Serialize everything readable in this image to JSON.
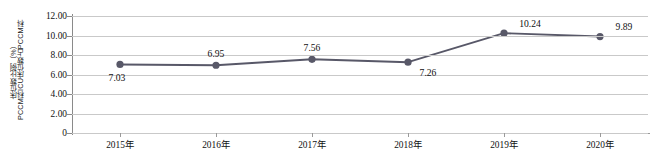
{
  "chart_data": {
    "type": "line",
    "title": "",
    "subtitle": "",
    "xlabel": "",
    "ylabel": "PCCM科ICU床位数占PCCM科床位数比例（%）",
    "ylabel_line1": "PCCM科ICU床位数占PCCM科",
    "ylabel_line2": "床位数比例（%）",
    "categories": [
      "2015年",
      "2016年",
      "2017年",
      "2018年",
      "2019年",
      "2020年"
    ],
    "values": [
      7.03,
      6.95,
      7.56,
      7.26,
      10.24,
      9.89
    ],
    "point_labels": [
      "7.03",
      "6.95",
      "7.56",
      "7.26",
      "10.24",
      "9.89"
    ],
    "ylim": [
      0,
      12
    ],
    "ytick_values": [
      0,
      2,
      4,
      6,
      8,
      10,
      12
    ],
    "ytick_labels": [
      "0",
      "2.00",
      "4.00",
      "6.00",
      "8.00",
      "10.00",
      "12.00"
    ],
    "grid": true,
    "grid_axis": "y",
    "legend": false,
    "legend_position": "none",
    "series_color": "#585868",
    "marker": "circle",
    "marker_color": "#585868",
    "gridline_color": "#c9c9c9",
    "axis_color": "#8a8a8a",
    "text_color": "#111111",
    "background": "#ffffff",
    "label_offsets": [
      {
        "dx": -3,
        "dy": 13
      },
      {
        "dx": 0,
        "dy": -12
      },
      {
        "dx": 0,
        "dy": -12
      },
      {
        "dx": 20,
        "dy": 10
      },
      {
        "dx": 26,
        "dy": -10
      },
      {
        "dx": 24,
        "dy": -11
      }
    ]
  }
}
